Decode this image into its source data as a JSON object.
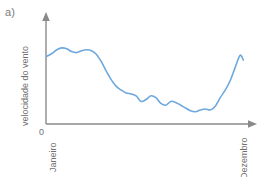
{
  "figure": {
    "panel_label": "a)",
    "axis_color": "#8a8a8a",
    "text_color": "#6f6f6f",
    "background": "#ffffff"
  },
  "chart_data": {
    "type": "line",
    "title": "",
    "subtitle": "",
    "xlabel": "",
    "ylabel": "velocidade do vento",
    "x_tick_labels": [
      "Janeiro",
      "Dezembro"
    ],
    "y_tick_labels": [
      "0"
    ],
    "origin_label": "0",
    "grid": false,
    "legend": null,
    "legend_position": "none",
    "axis_arrows": true,
    "line_color": "#6fa8dc",
    "line_width": 1.6,
    "xlim": [
      0,
      12
    ],
    "ylim": [
      0,
      10
    ],
    "annotations": [],
    "series": [
      {
        "name": "velocidade do vento",
        "x": [
          0.0,
          0.3,
          0.6,
          0.9,
          1.2,
          1.5,
          1.8,
          2.1,
          2.4,
          2.7,
          3.0,
          3.3,
          3.6,
          3.9,
          4.2,
          4.5,
          4.8,
          5.1,
          5.4,
          5.7,
          6.0,
          6.3,
          6.6,
          6.9,
          7.2,
          7.5,
          7.8,
          8.1,
          8.4,
          8.7,
          9.0,
          9.3,
          9.6,
          9.9,
          10.2,
          10.5,
          10.8,
          11.1,
          11.4,
          11.7,
          11.9
        ],
        "values": [
          7.2,
          7.5,
          7.9,
          8.1,
          8.0,
          7.7,
          7.6,
          7.8,
          7.9,
          7.8,
          7.4,
          6.6,
          5.6,
          4.7,
          4.0,
          3.6,
          3.3,
          3.2,
          3.0,
          2.4,
          2.6,
          3.0,
          2.8,
          2.2,
          2.0,
          2.4,
          2.3,
          2.0,
          1.7,
          1.4,
          1.3,
          1.5,
          1.6,
          1.5,
          1.9,
          2.8,
          3.6,
          4.6,
          6.0,
          7.3,
          6.8
        ]
      }
    ]
  },
  "accessibility": {
    "curve_name": "wind-speed-curve",
    "description": "velocidade do vento de Janeiro a Dezembro"
  }
}
